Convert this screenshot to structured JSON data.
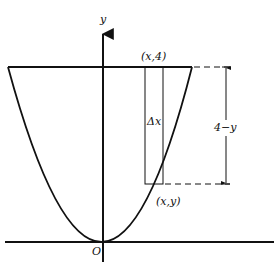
{
  "diagram": {
    "type": "geometry-figure",
    "colors": {
      "ink": "#111111",
      "background": "#ffffff"
    },
    "axes": {
      "x_axis": {
        "label": ""
      },
      "y_axis": {
        "label": "y"
      },
      "origin_label": "O"
    },
    "curve": {
      "kind": "parabola",
      "vertex_label": "O"
    },
    "upper_bound": {
      "kind": "horizontal-line",
      "value": "4"
    },
    "strip": {
      "top_label": "(x,4)",
      "bottom_label": "(x,y)",
      "width_label": "Δx"
    },
    "dimension": {
      "label": "4−y",
      "style": "double-arrow with dashed extension lines"
    }
  }
}
